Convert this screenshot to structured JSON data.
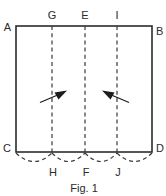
{
  "figure": {
    "caption": "Fig. 1",
    "colors": {
      "line": "#2b2b2b",
      "dashed": "#3a3a3a",
      "arrow": "#1c1c1c",
      "background": "#ffffff"
    },
    "sheet": {
      "name": "rectangular-sheet",
      "corners": {
        "top_left": "A",
        "top_right": "B",
        "bottom_left": "C",
        "bottom_right": "D"
      },
      "bounds": {
        "left": 16,
        "top": 26,
        "right": 152,
        "bottom": 152
      }
    },
    "fold_lines": [
      {
        "id": "fold-line-gh",
        "top_label": "G",
        "bottom_label": "H",
        "x": 52
      },
      {
        "id": "fold-line-ef",
        "top_label": "E",
        "bottom_label": "F",
        "x": 85
      },
      {
        "id": "fold-line-ij",
        "top_label": "I",
        "bottom_label": "J",
        "x": 117
      }
    ],
    "arrows": [
      {
        "id": "arrow-left",
        "direction": "right",
        "from_x": 40,
        "from_y": 103,
        "to_x": 66,
        "to_y": 92
      },
      {
        "id": "arrow-right",
        "direction": "left",
        "from_x": 130,
        "from_y": 103,
        "to_x": 103,
        "to_y": 92
      }
    ],
    "arcs": [
      {
        "id": "arc-c-h",
        "start_x": 16,
        "end_x": 52
      },
      {
        "id": "arc-h-f",
        "start_x": 52,
        "end_x": 85
      },
      {
        "id": "arc-f-j",
        "start_x": 85,
        "end_x": 117
      },
      {
        "id": "arc-j-d",
        "start_x": 117,
        "end_x": 152
      }
    ]
  }
}
